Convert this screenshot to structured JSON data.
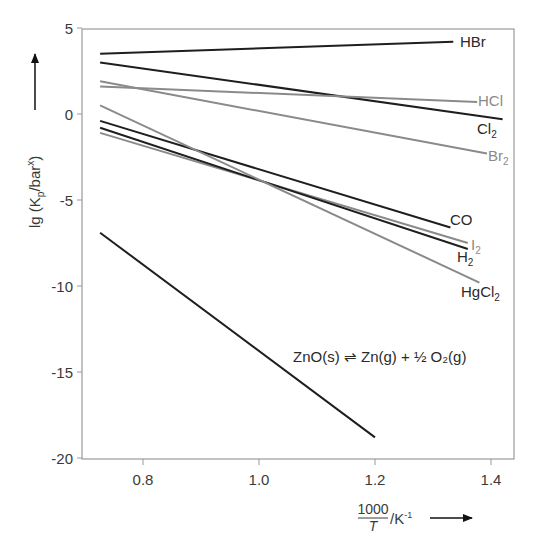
{
  "chart_data": {
    "type": "line",
    "title": "",
    "xlabel": "1000/T / K^-1",
    "xlabel_parts": {
      "numerator": "1000",
      "denominator": "T",
      "unit": "/K",
      "exponent": "-1"
    },
    "ylabel": "lg (Kp/bar^x)",
    "ylabel_parts": {
      "prefix": "lg (K",
      "sub": "p",
      "mid": "/bar",
      "sup": "x",
      "suffix": ")"
    },
    "xlim": [
      0.695,
      1.445
    ],
    "ylim": [
      -20,
      5
    ],
    "xticks": [
      0.8,
      1.0,
      1.2,
      1.4
    ],
    "xtick_labels": [
      "0.8",
      "1.0",
      "1.2",
      "1.4"
    ],
    "yticks": [
      5,
      0,
      -5,
      -10,
      -15,
      -20
    ],
    "ytick_labels": [
      "5",
      "0",
      "-5",
      "-10",
      "-15",
      "-20"
    ],
    "grid": false,
    "legend": "inline labels at line ends",
    "annotation": "ZnO(s) ⇌ Zn(g) + ½ O₂(g)",
    "series": [
      {
        "name": "HBr",
        "label": "HBr",
        "sub": "",
        "color": "#1e1e1e",
        "x": [
          0.726,
          1.335
        ],
        "y": [
          3.5,
          4.2
        ]
      },
      {
        "name": "Cl2",
        "label": "Cl",
        "sub": "2",
        "color": "#1e1e1e",
        "x": [
          0.726,
          1.42
        ],
        "y": [
          3.0,
          -0.3
        ]
      },
      {
        "name": "HCl",
        "label": "HCl",
        "sub": "",
        "color": "#8a8a8a",
        "x": [
          0.726,
          1.376
        ],
        "y": [
          1.6,
          0.7
        ]
      },
      {
        "name": "Br2",
        "label": "Br",
        "sub": "2",
        "color": "#8a8a8a",
        "x": [
          0.726,
          1.393
        ],
        "y": [
          1.9,
          -2.3
        ]
      },
      {
        "name": "CO",
        "label": "CO",
        "sub": "",
        "color": "#1e1e1e",
        "x": [
          0.726,
          1.33
        ],
        "y": [
          -0.4,
          -6.6
        ]
      },
      {
        "name": "I2",
        "label": "I",
        "sub": "2",
        "color": "#8a8a8a",
        "x": [
          0.726,
          1.36
        ],
        "y": [
          -1.1,
          -7.5
        ]
      },
      {
        "name": "H2",
        "label": "H",
        "sub": "2",
        "color": "#1e1e1e",
        "x": [
          0.726,
          1.36
        ],
        "y": [
          -0.8,
          -7.85
        ]
      },
      {
        "name": "HgCl2",
        "label": "HgCl",
        "sub": "2",
        "color": "#8a8a8a",
        "x": [
          0.726,
          1.38
        ],
        "y": [
          0.5,
          -9.8
        ]
      },
      {
        "name": "ZnO",
        "label": "",
        "sub": "",
        "color": "#1e1e1e",
        "x": [
          0.726,
          1.2
        ],
        "y": [
          -6.9,
          -18.8
        ]
      }
    ]
  }
}
